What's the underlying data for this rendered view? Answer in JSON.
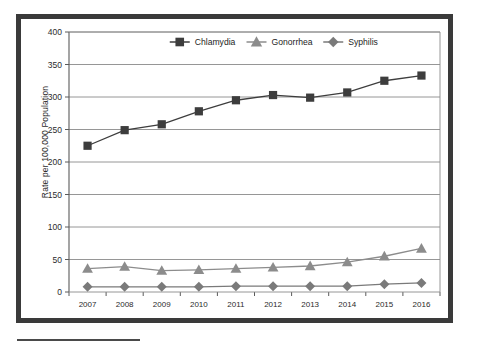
{
  "figure": {
    "ylabel": "Rate per 100,000 Population",
    "bottom_rule": "rule"
  },
  "axis": {
    "y_ticks": [
      "0",
      "50",
      "100",
      "150",
      "200",
      "250",
      "300",
      "350",
      "400"
    ],
    "x_ticks": [
      "2007",
      "2008",
      "2009",
      "2010",
      "2011",
      "2012",
      "2013",
      "2014",
      "2015",
      "2016"
    ]
  },
  "legend": {
    "items": [
      {
        "label": "Chlamydia",
        "marker": "square",
        "color": "#3d3d3d"
      },
      {
        "label": "Gonorrhea",
        "marker": "triangle",
        "color": "#8c8c8c"
      },
      {
        "label": "Syphilis",
        "marker": "diamond",
        "color": "#7a7a7a"
      }
    ]
  },
  "colors": {
    "chlamydia": "#3d3d3d",
    "gonorrhea": "#8c8c8c",
    "syphilis": "#7a7a7a",
    "grid": "#8a8a8a",
    "axis": "#5a5a5a",
    "frame": "#3a3a3a"
  },
  "chart_data": {
    "type": "line",
    "title": "",
    "xlabel": "",
    "ylabel": "Rate per 100,000 Population",
    "x": [
      2007,
      2008,
      2009,
      2010,
      2011,
      2012,
      2013,
      2014,
      2015,
      2016
    ],
    "categories": [
      "2007",
      "2008",
      "2009",
      "2010",
      "2011",
      "2012",
      "2013",
      "2014",
      "2015",
      "2016"
    ],
    "ylim": [
      0,
      400
    ],
    "ytick_step": 50,
    "grid": true,
    "legend_position": "top-center",
    "series": [
      {
        "name": "Chlamydia",
        "marker": "square",
        "color": "#3d3d3d",
        "values": [
          225,
          249,
          258,
          278,
          295,
          303,
          299,
          307,
          325,
          333
        ]
      },
      {
        "name": "Gonorrhea",
        "marker": "triangle",
        "color": "#8c8c8c",
        "values": [
          36,
          39,
          33,
          34,
          36,
          38,
          40,
          46,
          55,
          67
        ]
      },
      {
        "name": "Syphilis",
        "marker": "diamond",
        "color": "#7a7a7a",
        "values": [
          8,
          8,
          8,
          8,
          9,
          9,
          9,
          9,
          12,
          14
        ]
      }
    ]
  }
}
